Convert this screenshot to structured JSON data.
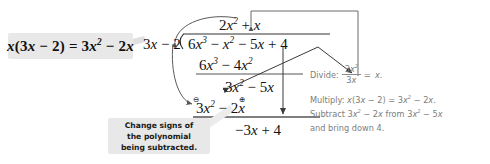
{
  "diagram": {
    "colors": {
      "ink": "#111111",
      "callout_bg": "#e8e8e8",
      "callout_text": "#1a1a1a",
      "annotation_text": "#7d7d7d",
      "rule": "#444444",
      "arrow": "#555555",
      "page_bg": "#ffffff"
    }
  },
  "callouts": {
    "multiply": {
      "text": "x(3x − 2) = 3x² − 2x",
      "parts": {
        "lhs": "x(3x − 2)",
        "eq": "=",
        "rhs": "3x² − 2x"
      }
    },
    "change_signs": {
      "line1": "Change signs of",
      "line2": "the polynomial",
      "line3": "being subtracted."
    }
  },
  "long_division": {
    "divisor": {
      "coef": "3",
      "var": "x",
      "op": "−",
      "constant": "2"
    },
    "divisor_text": "3x − 2",
    "quotient_text": "2x² + x",
    "quotient_terms": [
      "2x²",
      "+",
      "x"
    ],
    "dividend_text": "6x³ − x² − 5x + 4",
    "dividend_terms": [
      "6x³",
      "−",
      "x²",
      "−",
      "5x",
      "+",
      "4"
    ],
    "steps": [
      {
        "label": "product-1",
        "text": "6x³ − 4x²"
      },
      {
        "label": "remainder-1",
        "text": "3x² − 5x"
      },
      {
        "label": "product-2",
        "text": "3x² − 2x"
      },
      {
        "label": "remainder-2",
        "text": "−3x + 4"
      }
    ],
    "sign_markers": {
      "circled_minus": "⊖",
      "circled_plus": "⊕"
    }
  },
  "explanation": {
    "divide_label": "Divide:",
    "divide_fraction": {
      "numerator": "3x²",
      "denominator": "3x"
    },
    "divide_equals": "=",
    "divide_result": "x.",
    "multiply_line": "Multiply: x(3x − 2) = 3x² − 2x.",
    "subtract_line_1": "Subtract 3x² − 2x from 3x² − 5x",
    "subtract_line_2": "and bring down 4."
  },
  "annotations": {
    "arrow_divisor_to_quotient": "curve from divisor 3x up to quotient term 2x²",
    "arrow_divisor_to_product": "curve from divisor 3x down to product 3x²",
    "arrow_bracket_to_quotient": "bracket from right margin down-left to quotient term x",
    "arrow_remainder_to_divide": "V-shaped connector from remainder 3x² − 5x to the Divide fraction",
    "arrow_down_to_remainder2": "vertical arrow down to −3x + 4"
  }
}
